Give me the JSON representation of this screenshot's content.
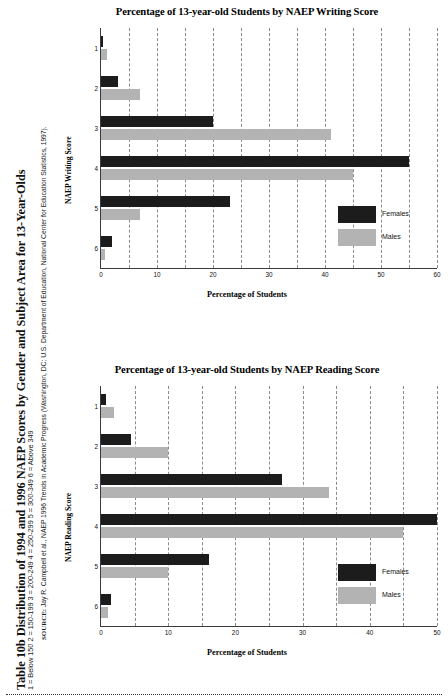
{
  "table": {
    "title": "Table 10b Distribution of 1994 and 1996 NAEP Scores by Gender and Subject Area for 13-Year-Olds",
    "subtitle": "1 = Below 150   2 = 150-199   3 = 200-249   4 = 250-299   5 = 300-349   6 = Above 349",
    "source_label": "SOURCE:",
    "source_text": " Jay R. Campbell et al., NAEP 1996 Trends in Academic Progress (Washington, DC: U.S. Department of Education, National Center for Education Statistics, 1997)."
  },
  "legend": {
    "females": "Females",
    "males": "Males",
    "females_color": "#1c1c1c",
    "males_color": "#b3b3b3"
  },
  "chart_data": [
    {
      "id": "writing",
      "type": "bar",
      "orientation": "horizontal",
      "title": "Percentage of 13-year-old Students by NAEP Writing Score",
      "xlabel": "Percentage of Students",
      "ylabel": "NAEP Writing Score",
      "categories": [
        "1",
        "2",
        "3",
        "4",
        "5",
        "6"
      ],
      "xlim": [
        0,
        60
      ],
      "xticks": [
        0,
        10,
        20,
        30,
        40,
        50,
        60
      ],
      "minor_gridline_step": 5,
      "grid": true,
      "legend_position": "bottom-right",
      "series": [
        {
          "name": "Females",
          "color": "#1c1c1c",
          "values": [
            0.3,
            3,
            20,
            55,
            23,
            2
          ]
        },
        {
          "name": "Males",
          "color": "#b3b3b3",
          "values": [
            1,
            7,
            41,
            45,
            7,
            0.7
          ]
        }
      ]
    },
    {
      "id": "reading",
      "type": "bar",
      "orientation": "horizontal",
      "title": "Percentage of 13-year-old Students by NAEP Reading Score",
      "xlabel": "Percentage of Students",
      "ylabel": "NAEP Reading Score",
      "categories": [
        "1",
        "2",
        "3",
        "4",
        "5",
        "6"
      ],
      "xlim": [
        0,
        50
      ],
      "xticks": [
        0,
        10,
        20,
        30,
        40,
        50
      ],
      "minor_gridline_step": 5,
      "grid": true,
      "legend_position": "bottom-right",
      "series": [
        {
          "name": "Females",
          "color": "#1c1c1c",
          "values": [
            0.8,
            4.5,
            27,
            50,
            16,
            1.5
          ]
        },
        {
          "name": "Males",
          "color": "#b3b3b3",
          "values": [
            2,
            10,
            34,
            45,
            10,
            1
          ]
        }
      ]
    }
  ]
}
